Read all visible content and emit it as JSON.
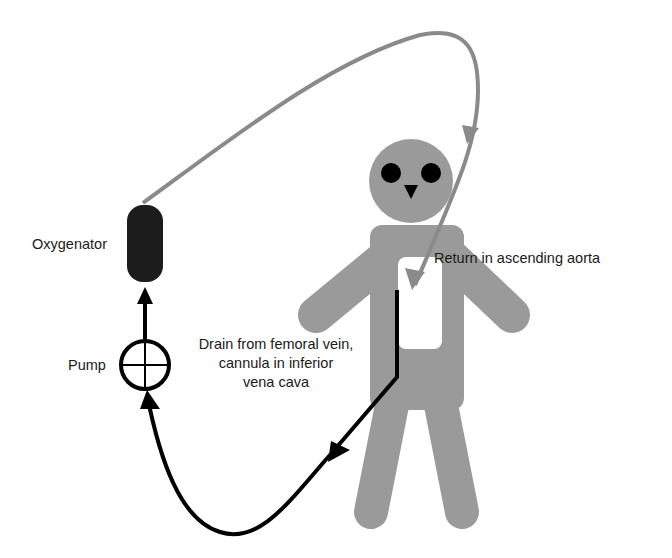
{
  "diagram": {
    "type": "ECMO circuit schematic (femoro-aortic)",
    "labels": {
      "oxygenator": "Oxygenator",
      "pump": "Pump",
      "drain": [
        "Drain from femoral vein,",
        "cannula in inferior",
        "vena cava"
      ],
      "return": "Return in ascending aorta"
    },
    "components": [
      {
        "id": "oxygenator",
        "shape": "rounded-rectangle",
        "color": "#1c1c1c"
      },
      {
        "id": "pump",
        "shape": "circle-with-crosshair",
        "color": "#000000"
      },
      {
        "id": "patient",
        "shape": "stick-figure",
        "color": "#9a9a9a"
      }
    ],
    "flows": [
      {
        "from": "femoral-vein-cannula",
        "to": "pump",
        "line_color": "#000000",
        "kind": "venous drainage"
      },
      {
        "from": "pump",
        "to": "oxygenator",
        "line_color": "#000000",
        "kind": "pumped blood"
      },
      {
        "from": "oxygenator",
        "to": "ascending-aorta",
        "line_color": "#8a8a8a",
        "kind": "oxygenated return"
      }
    ],
    "colors": {
      "figure": "#9a9a9a",
      "venous_line": "#000000",
      "arterial_line": "#8a8a8a",
      "oxygenator": "#1c1c1c",
      "background": "#ffffff"
    }
  }
}
